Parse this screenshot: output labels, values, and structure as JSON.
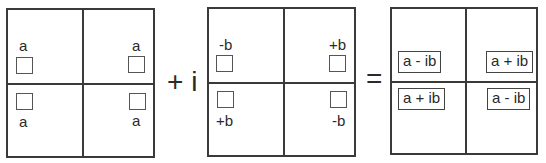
{
  "diagram": {
    "matrix_a": {
      "cells": [
        {
          "position": "top-left",
          "label": "a"
        },
        {
          "position": "top-right",
          "label": "a"
        },
        {
          "position": "bottom-left",
          "label": "a"
        },
        {
          "position": "bottom-right",
          "label": "a"
        }
      ]
    },
    "operator_plus_i": "+ i",
    "matrix_b": {
      "cells": [
        {
          "position": "top-left",
          "label": "-b"
        },
        {
          "position": "top-right",
          "label": "+b"
        },
        {
          "position": "bottom-left",
          "label": "+b"
        },
        {
          "position": "bottom-right",
          "label": "-b"
        }
      ]
    },
    "operator_equals": "=",
    "matrix_result": {
      "cells": [
        {
          "position": "top-left",
          "label": "a - ib"
        },
        {
          "position": "top-right",
          "label": "a + ib"
        },
        {
          "position": "bottom-left",
          "label": "a + ib"
        },
        {
          "position": "bottom-right",
          "label": "a - ib"
        }
      ]
    },
    "colors": {
      "line": "#3a3a3a",
      "text": "#2a2a2a",
      "background": "#ffffff"
    }
  }
}
